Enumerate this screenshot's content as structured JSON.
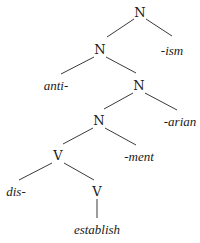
{
  "diagram": {
    "type": "morphological-tree",
    "nodes": {
      "n1": {
        "label": "N",
        "kind": "category"
      },
      "n2": {
        "label": "N",
        "kind": "category"
      },
      "ism": {
        "label": "-ism",
        "kind": "suffix"
      },
      "anti": {
        "label": "anti-",
        "kind": "prefix"
      },
      "n3": {
        "label": "N",
        "kind": "category"
      },
      "n4": {
        "label": "N",
        "kind": "category"
      },
      "arian": {
        "label": "-arian",
        "kind": "suffix"
      },
      "v1": {
        "label": "V",
        "kind": "category"
      },
      "ment": {
        "label": "-ment",
        "kind": "suffix"
      },
      "dis": {
        "label": "dis-",
        "kind": "prefix"
      },
      "v2": {
        "label": "V",
        "kind": "category"
      },
      "establish": {
        "label": "establish",
        "kind": "root"
      }
    },
    "edges": [
      [
        "n1",
        "n2"
      ],
      [
        "n1",
        "ism"
      ],
      [
        "n2",
        "anti"
      ],
      [
        "n2",
        "n3"
      ],
      [
        "n3",
        "n4"
      ],
      [
        "n3",
        "arian"
      ],
      [
        "n4",
        "v1"
      ],
      [
        "n4",
        "ment"
      ],
      [
        "v1",
        "dis"
      ],
      [
        "v1",
        "v2"
      ],
      [
        "v2",
        "establish"
      ]
    ]
  }
}
